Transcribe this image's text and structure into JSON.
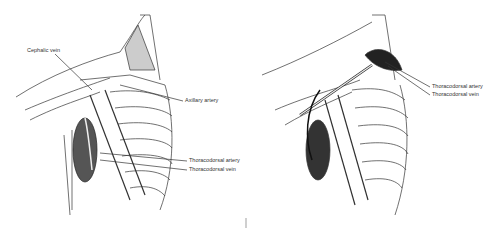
{
  "figure": {
    "panels": [
      {
        "id": "left",
        "labels": [
          {
            "text": "Cephalic vein",
            "x": 27,
            "y": 51
          },
          {
            "text": "Axillary artery",
            "x": 185,
            "y": 100
          },
          {
            "text": "Thoracodorsal artery",
            "x": 190,
            "y": 160
          },
          {
            "text": "Thoracodorsal vein",
            "x": 190,
            "y": 169
          }
        ]
      },
      {
        "id": "right",
        "labels": [
          {
            "text": "Thoracodorsal artery",
            "x": 432,
            "y": 86
          },
          {
            "text": "Thoracodorsal vein",
            "x": 432,
            "y": 94
          }
        ]
      }
    ]
  }
}
